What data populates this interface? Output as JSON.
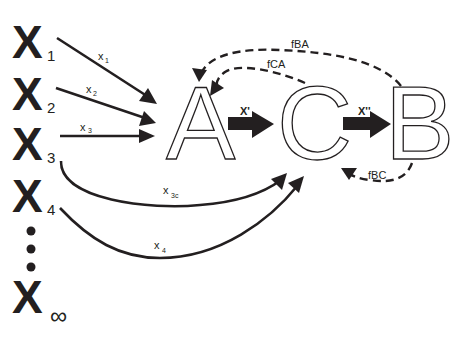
{
  "inputs": [
    {
      "symbol": "X",
      "subscript": "1",
      "arrow_label": "x",
      "arrow_label_sub": "1"
    },
    {
      "symbol": "X",
      "subscript": "2",
      "arrow_label": "x",
      "arrow_label_sub": "2"
    },
    {
      "symbol": "X",
      "subscript": "3",
      "arrow_label": "x",
      "arrow_label_sub": "3",
      "curve_label": "x",
      "curve_label_sub": "3c"
    },
    {
      "symbol": "X",
      "subscript": "4",
      "curve_label": "x",
      "curve_label_sub": "4"
    },
    {
      "symbol": "X",
      "subscript": "∞"
    }
  ],
  "ellipsis": "⋮",
  "nodes": {
    "a": "A",
    "c": "C",
    "b": "B"
  },
  "forward_arrows": {
    "a_to_c": "X'",
    "c_to_b": "X''"
  },
  "feedback": {
    "b_to_a": "fBA",
    "c_to_a": "fCA",
    "b_to_c": "fBC"
  }
}
